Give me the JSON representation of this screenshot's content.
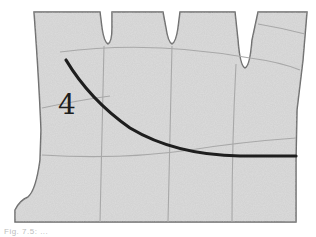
{
  "figure": {
    "label": "4",
    "colors": {
      "background": "#ffffff",
      "palm_fill": "#d9d9d9",
      "outline": "#6a6a6a",
      "creases": "#a8a8a8",
      "highlight_line": "#1e1e1e"
    }
  },
  "caption": {
    "text": "Fig. 7.5: ..."
  }
}
